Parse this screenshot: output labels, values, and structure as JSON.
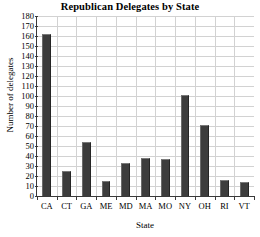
{
  "chart_data": {
    "type": "bar",
    "title": "Republican Delegates by State",
    "xlabel": "State",
    "ylabel": "Number of delegates",
    "categories": [
      "CA",
      "CT",
      "GA",
      "ME",
      "MD",
      "MA",
      "MO",
      "NY",
      "OH",
      "RI",
      "VT"
    ],
    "values": [
      162,
      25,
      54,
      15,
      33,
      38,
      37,
      101,
      71,
      16,
      14
    ],
    "ylim": [
      0,
      180
    ],
    "ytick_step": 10,
    "yticks": [
      0,
      10,
      20,
      30,
      40,
      50,
      60,
      70,
      80,
      90,
      100,
      110,
      120,
      130,
      140,
      150,
      160,
      170,
      180
    ],
    "grid": true,
    "legend": "none",
    "bar_color": "#3d3d3d",
    "grid_color": "#d2d2d2",
    "axis_color": "#3a3a3a",
    "background_color": "#ffffff"
  }
}
